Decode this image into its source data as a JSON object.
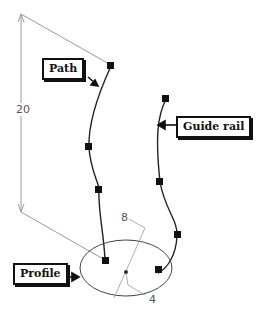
{
  "callouts": {
    "path": "Path",
    "guide_rail": "Guide rail",
    "profile": "Profile"
  },
  "dimensions": {
    "height": "20",
    "radius_a": "8",
    "radius_b": "4"
  },
  "colors": {
    "curve": "#222222",
    "dimension_line": "#9a9a9a",
    "control_point": "#111111"
  }
}
